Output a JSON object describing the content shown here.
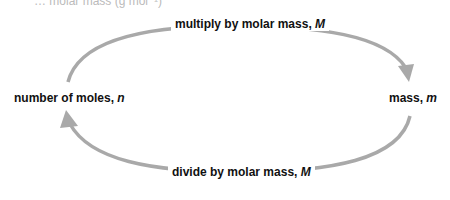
{
  "header_fragment": "… molar mass (g mol⁻¹)",
  "nodes": {
    "left": {
      "text": "number of moles, ",
      "var": "n"
    },
    "right": {
      "text": "mass, ",
      "var": "m"
    }
  },
  "arrows": {
    "top": {
      "text": "multiply by molar mass, ",
      "var": "M",
      "direction": "left-to-right"
    },
    "bottom": {
      "text": "divide by molar mass, ",
      "var": "M",
      "direction": "right-to-left"
    }
  },
  "colors": {
    "arrow": "#a9a9a9",
    "text": "#111111"
  }
}
